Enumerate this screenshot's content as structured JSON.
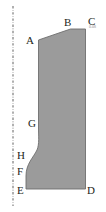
{
  "figure": {
    "width": 106,
    "height": 212,
    "background": "#ffffff"
  },
  "colors": {
    "fill": "#9b9b9b",
    "stroke": "#6e6e6e",
    "label": "#231f20",
    "axis": "#b0b0b0",
    "note": "#8d8d8d"
  },
  "axis": {
    "name": "centerline-axis",
    "style": "dash-dot",
    "x": 13,
    "y_top": 6,
    "y_bottom": 206
  },
  "shape": {
    "name": "cross-section-region",
    "fill": "#9b9b9b",
    "stroke": "#6e6e6e",
    "path": "M 38.5 40 L 70.5 29 L 85.5 29 L 85.5 189 L 26 189 L 26 176 C 26 164 33 158 37 150 C 39.5 144 38.5 136 38.5 128 Z"
  },
  "vertices": [
    {
      "id": "A",
      "label": "A",
      "x": 26,
      "y": 35
    },
    {
      "id": "B",
      "label": "B",
      "x": 64,
      "y": 17
    },
    {
      "id": "C",
      "label": "C",
      "x": 88,
      "y": 16
    },
    {
      "id": "D",
      "label": "D",
      "x": 87,
      "y": 185
    },
    {
      "id": "E",
      "label": "E",
      "x": 17,
      "y": 185
    },
    {
      "id": "F",
      "label": "F",
      "x": 17,
      "y": 166
    },
    {
      "id": "G",
      "label": "G",
      "x": 28,
      "y": 118
    },
    {
      "id": "H",
      "label": "H",
      "x": 17,
      "y": 150
    }
  ],
  "annotations": [
    {
      "id": "c-note",
      "text": "0.08",
      "x": 89,
      "y": 25
    }
  ]
}
